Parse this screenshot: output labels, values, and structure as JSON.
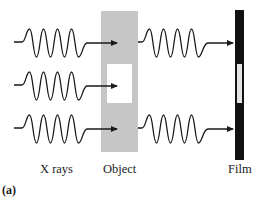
{
  "figure": {
    "panel_label": "(a)",
    "labels": {
      "source": "X rays",
      "object": "Object",
      "film": "Film"
    },
    "colors": {
      "background": "#ffffff",
      "object_fill": "#c6c6c6",
      "object_window": "#ffffff",
      "film_fill": "#111111",
      "film_window": "#e4e4e4",
      "wave_stroke": "#1a1a1a"
    },
    "rays": [
      {
        "row": 1,
        "passes_object": true,
        "reaches_film": true
      },
      {
        "row": 2,
        "passes_object": false,
        "reaches_film": false
      },
      {
        "row": 3,
        "passes_object": true,
        "reaches_film": true
      }
    ]
  }
}
